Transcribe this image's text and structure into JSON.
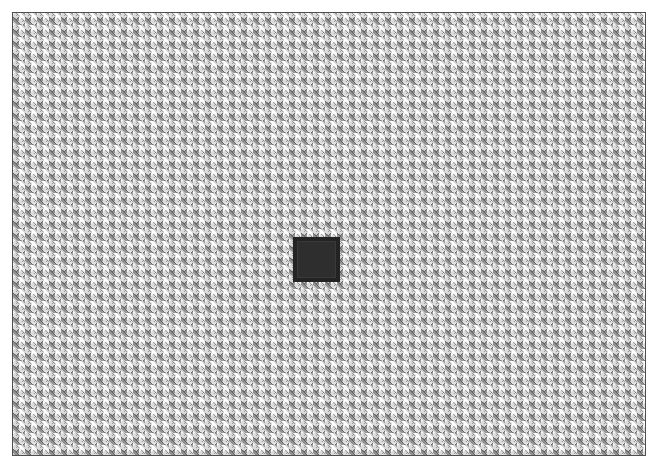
{
  "canvas": {
    "width": 659,
    "height": 470,
    "background_color": "#ffffff"
  },
  "frame": {
    "name": "textured-panel-frame",
    "border_color": "#4f4f4f",
    "border_width_px": 1,
    "left": 12,
    "top": 12,
    "width": 634,
    "height": 444
  },
  "texture": {
    "name": "basket-weave-pattern",
    "description": "interlocking diagonal woven strands",
    "tile_period_px": 12,
    "base_color": "#e4e4e4",
    "strand_colors": [
      "#ffffff",
      "#d6d6d6",
      "#9c9c9c",
      "#6d6d6d"
    ]
  },
  "marker": {
    "name": "center-dark-square",
    "left": 280,
    "top": 224,
    "width": 47,
    "height": 45,
    "fill_color": "#2e2e2e",
    "rim_color": "#232323",
    "inner_outline_color": "#3a3a3a"
  }
}
